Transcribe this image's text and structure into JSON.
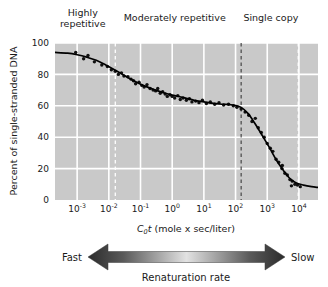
{
  "chart_data": {
    "type": "scatter",
    "title": "",
    "xlabel": "C0t (mole x sec/liter)",
    "ylabel": "Percent of single-stranded DNA",
    "xscale": "log",
    "xlim": [
      0.0002,
      40000
    ],
    "ylim": [
      0,
      100
    ],
    "grid": true,
    "legend": "none",
    "xticks": [
      {
        "mantissa": "10",
        "exponent": "-3",
        "value": 0.001
      },
      {
        "mantissa": "10",
        "exponent": "-2",
        "value": 0.01
      },
      {
        "mantissa": "10",
        "exponent": "-1",
        "value": 0.1
      },
      {
        "mantissa": "10",
        "exponent": "0",
        "value": 1
      },
      {
        "mantissa": "10",
        "exponent": "1",
        "value": 10
      },
      {
        "mantissa": "10",
        "exponent": "2",
        "value": 100
      },
      {
        "mantissa": "10",
        "exponent": "3",
        "value": 1000
      },
      {
        "mantissa": "10",
        "exponent": "4",
        "value": 10000
      }
    ],
    "yticks": [
      0,
      20,
      40,
      60,
      80,
      100
    ],
    "region_labels": [
      {
        "text": "Highly repetitive",
        "lines": [
          "Highly",
          "repetitive"
        ],
        "center_value": 0.0015
      },
      {
        "text": "Moderately repetitive",
        "lines": [
          "Moderately repetitive"
        ],
        "center_value": 1.2
      },
      {
        "text": "Single copy",
        "lines": [
          "Single copy"
        ],
        "center_value": 1300
      }
    ],
    "region_dividers": [
      {
        "value": 0.016,
        "style": "light"
      },
      {
        "value": 150,
        "style": "dark"
      },
      {
        "value": 9500,
        "style": "light"
      }
    ],
    "curve": {
      "name": "Renaturation curve",
      "x": [
        0.0002,
        0.0005,
        0.001,
        0.002,
        0.004,
        0.008,
        0.015,
        0.03,
        0.06,
        0.12,
        0.3,
        0.6,
        1.2,
        2.5,
        5,
        10,
        20,
        40,
        80,
        150,
        250,
        400,
        700,
        1200,
        2000,
        3200,
        5000,
        8000,
        14000,
        25000,
        40000
      ],
      "y": [
        94,
        93.5,
        92.5,
        91,
        89,
        86,
        83,
        79.5,
        76,
        73,
        70,
        68,
        66.5,
        65,
        63.5,
        62.5,
        61.5,
        61,
        60.5,
        59,
        55,
        49,
        41,
        33,
        25,
        19,
        14,
        11,
        9.5,
        8.5,
        8
      ]
    },
    "points": [
      {
        "x": 0.0009,
        "y": 94
      },
      {
        "x": 0.0016,
        "y": 90
      },
      {
        "x": 0.0022,
        "y": 92
      },
      {
        "x": 0.0035,
        "y": 88
      },
      {
        "x": 0.006,
        "y": 86
      },
      {
        "x": 0.009,
        "y": 85
      },
      {
        "x": 0.012,
        "y": 83
      },
      {
        "x": 0.016,
        "y": 82
      },
      {
        "x": 0.02,
        "y": 80
      },
      {
        "x": 0.025,
        "y": 81
      },
      {
        "x": 0.03,
        "y": 79
      },
      {
        "x": 0.04,
        "y": 78.5
      },
      {
        "x": 0.05,
        "y": 77
      },
      {
        "x": 0.06,
        "y": 76
      },
      {
        "x": 0.07,
        "y": 74
      },
      {
        "x": 0.09,
        "y": 75
      },
      {
        "x": 0.11,
        "y": 73
      },
      {
        "x": 0.13,
        "y": 72
      },
      {
        "x": 0.16,
        "y": 73.5
      },
      {
        "x": 0.2,
        "y": 71
      },
      {
        "x": 0.25,
        "y": 70
      },
      {
        "x": 0.3,
        "y": 69.5
      },
      {
        "x": 0.35,
        "y": 71
      },
      {
        "x": 0.42,
        "y": 68
      },
      {
        "x": 0.5,
        "y": 69
      },
      {
        "x": 0.6,
        "y": 67.5
      },
      {
        "x": 0.7,
        "y": 66
      },
      {
        "x": 0.85,
        "y": 67
      },
      {
        "x": 1.0,
        "y": 66
      },
      {
        "x": 1.2,
        "y": 65
      },
      {
        "x": 1.5,
        "y": 66.5
      },
      {
        "x": 1.8,
        "y": 64
      },
      {
        "x": 2.2,
        "y": 65
      },
      {
        "x": 2.8,
        "y": 63.5
      },
      {
        "x": 3.5,
        "y": 64.5
      },
      {
        "x": 4.2,
        "y": 62.5
      },
      {
        "x": 5.5,
        "y": 63
      },
      {
        "x": 7,
        "y": 62
      },
      {
        "x": 9,
        "y": 63.5
      },
      {
        "x": 12,
        "y": 61.5
      },
      {
        "x": 16,
        "y": 62.5
      },
      {
        "x": 22,
        "y": 61
      },
      {
        "x": 30,
        "y": 62
      },
      {
        "x": 42,
        "y": 60.5
      },
      {
        "x": 60,
        "y": 61
      },
      {
        "x": 85,
        "y": 60
      },
      {
        "x": 110,
        "y": 59
      },
      {
        "x": 150,
        "y": 58
      },
      {
        "x": 200,
        "y": 56
      },
      {
        "x": 260,
        "y": 54
      },
      {
        "x": 330,
        "y": 50
      },
      {
        "x": 420,
        "y": 52
      },
      {
        "x": 520,
        "y": 46
      },
      {
        "x": 650,
        "y": 43
      },
      {
        "x": 800,
        "y": 40
      },
      {
        "x": 1000,
        "y": 36
      },
      {
        "x": 1250,
        "y": 33
      },
      {
        "x": 1500,
        "y": 31
      },
      {
        "x": 1900,
        "y": 26
      },
      {
        "x": 2300,
        "y": 24
      },
      {
        "x": 2900,
        "y": 20
      },
      {
        "x": 3600,
        "y": 17
      },
      {
        "x": 4300,
        "y": 16
      },
      {
        "x": 5200,
        "y": 13
      },
      {
        "x": 6200,
        "y": 12
      },
      {
        "x": 7500,
        "y": 10
      },
      {
        "x": 9000,
        "y": 9.5
      },
      {
        "x": 3000,
        "y": 22
      },
      {
        "x": 5800,
        "y": 9
      },
      {
        "x": 11000,
        "y": 8.5
      }
    ]
  },
  "annotations": {
    "rate_arrow": {
      "left_label": "Fast",
      "right_label": "Slow",
      "caption": "Renaturation rate"
    }
  },
  "colors": {
    "plot_background": "#c9c9c9",
    "gridline": "#ffffff",
    "curve": "#000000",
    "point": "#111111",
    "divider_dark": "#3a3a3a",
    "divider_light": "#ffffff",
    "text": "#1a1a1a"
  }
}
